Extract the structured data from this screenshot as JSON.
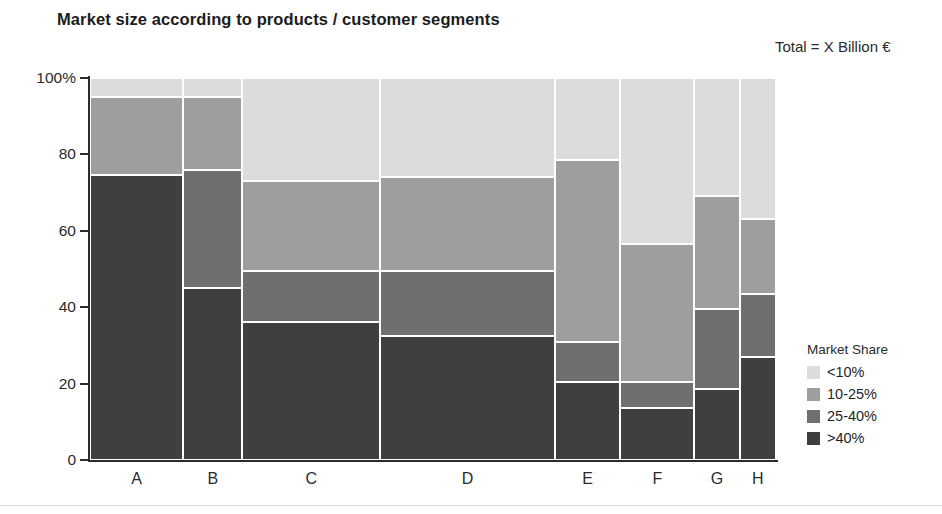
{
  "header": {
    "title": "Market size according to products / customer segments",
    "total_note": "Total = X Billion €"
  },
  "legend": {
    "title": "Market Share",
    "items": [
      {
        "label": "<10%",
        "color": "#dcdcdc"
      },
      {
        "label": "10-25%",
        "color": "#9e9e9e"
      },
      {
        "label": "25-40%",
        "color": "#6f6f6f"
      },
      {
        "label": ">40%",
        "color": "#3f3f3f"
      }
    ]
  },
  "axis": {
    "y_ticks": [
      "100%",
      "80",
      "60",
      "40",
      "20",
      "0"
    ],
    "y_values": [
      100,
      80,
      60,
      40,
      20,
      0
    ],
    "x_labels": [
      "A",
      "B",
      "C",
      "D",
      "E",
      "F",
      "G",
      "H"
    ]
  },
  "chart_data": {
    "type": "bar",
    "variant": "marimekko-mosaic-100-percent-stacked",
    "title": "Market size according to products / customer segments",
    "subtitle": "Total = X Billion €",
    "xlabel": "",
    "ylabel": "",
    "ylim": [
      0,
      100
    ],
    "grid": false,
    "legend_position": "right",
    "legend_title": "Market Share",
    "categories": [
      "A",
      "B",
      "C",
      "D",
      "E",
      "F",
      "G",
      "H"
    ],
    "column_widths_percent": [
      13.6,
      8.6,
      20.1,
      25.5,
      9.5,
      10.8,
      6.6,
      5.3
    ],
    "series": [
      {
        "name": "<10%",
        "color": "#dcdcdc",
        "values": [
          5.0,
          5.0,
          27.0,
          26.0,
          21.5,
          43.5,
          31.0,
          37.0
        ]
      },
      {
        "name": "10-25%",
        "color": "#9e9e9e",
        "values": [
          20.5,
          19.0,
          23.5,
          24.5,
          47.5,
          36.0,
          29.5,
          19.5
        ]
      },
      {
        "name": "25-40%",
        "color": "#6f6f6f",
        "values": [
          0.0,
          31.0,
          13.5,
          17.0,
          10.5,
          7.0,
          21.0,
          16.5
        ]
      },
      {
        "name": ">40%",
        "color": "#3f3f3f",
        "values": [
          74.5,
          45.0,
          36.0,
          32.5,
          20.5,
          13.5,
          18.5,
          27.0
        ]
      }
    ],
    "stack_boundaries_percent": {
      "A": [
        100,
        95.0,
        74.5,
        74.5,
        0
      ],
      "B": [
        100,
        95.0,
        76.0,
        45.0,
        0
      ],
      "C": [
        100,
        73.0,
        49.5,
        36.0,
        0
      ],
      "D": [
        100,
        74.0,
        49.5,
        32.5,
        0
      ],
      "E": [
        100,
        78.5,
        31.0,
        20.5,
        0
      ],
      "F": [
        100,
        56.5,
        20.5,
        13.5,
        0
      ],
      "G": [
        100,
        69.0,
        39.5,
        18.5,
        0
      ],
      "H": [
        100,
        63.0,
        43.5,
        27.0,
        0
      ]
    }
  }
}
